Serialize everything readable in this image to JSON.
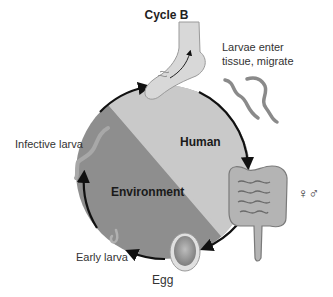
{
  "title": "Cycle B",
  "zones": {
    "human": "Human",
    "environment": "Environment"
  },
  "stages": {
    "larvae_enter_line1": "Larvae enter",
    "larvae_enter_line2": "tissue, migrate",
    "infective_larva": "Infective larva",
    "early_larva": "Early larva",
    "egg": "Egg",
    "adults_sex_symbols": "♀♂"
  },
  "colors": {
    "human_zone": "#c9c9c9",
    "environment_zone": "#8e8e8e",
    "arrows": "#111111",
    "worm": "#9a9a9a"
  },
  "icons": [
    "foot-icon",
    "larvae-worms-icon",
    "intestine-icon",
    "egg-icon",
    "infective-larva-icon",
    "early-larva-icon"
  ]
}
